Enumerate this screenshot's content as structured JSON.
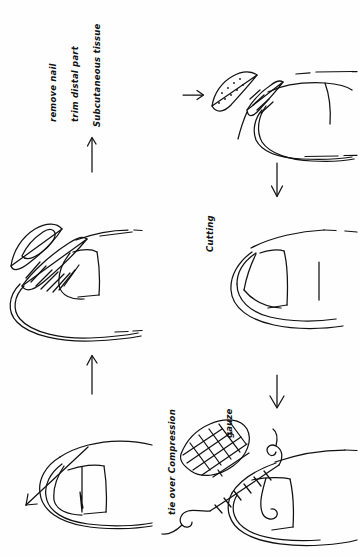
{
  "document": {
    "kind": "hand-drawn-diagram",
    "title": "Fingertip nail bed procedure sketch",
    "background_color": "#fefefe",
    "ink_color": "#111111",
    "width": 359,
    "height": 556
  },
  "annotations": {
    "remove_nail": "remove nail",
    "trim_distal_part": "trim distal part",
    "subcutaneous_tissue": "Subcutaneous tissue",
    "cutting": "Cutting",
    "tie_over_compression": "tie over Compression",
    "gauze": "gauze"
  },
  "panels": [
    {
      "id": "panel-top-right",
      "name": "nail-removal-panel",
      "step": 1,
      "description": "Fingertip with nail plate elevated and hatched nail bed exposed"
    },
    {
      "id": "panel-middle-right",
      "name": "cutting-panel",
      "step": 2,
      "description": "Fingertip outline with cutting line across the pulp"
    },
    {
      "id": "panel-bottom-right",
      "name": "tie-over-compression-panel",
      "step": 3,
      "description": "Fingertip with sutures and cross-hatched gauze bolster"
    },
    {
      "id": "panel-bottom-left",
      "name": "final-result-panel",
      "step": 4,
      "description": "Fingertip with closure line and directional arrow"
    },
    {
      "id": "panel-middle-left",
      "name": "flap-elevation-panel",
      "step": 5,
      "description": "Fingertip with elevated nail and hatched graft strip"
    }
  ],
  "arrows": [
    {
      "name": "arrow-right-top",
      "direction": "right",
      "x": 190,
      "y": 95
    },
    {
      "name": "arrow-down-right-upper",
      "direction": "down",
      "x": 277,
      "y": 170
    },
    {
      "name": "arrow-down-right-lower",
      "direction": "down",
      "x": 277,
      "y": 380
    },
    {
      "name": "arrow-up-left-lower",
      "direction": "up",
      "x": 92,
      "y": 355
    },
    {
      "name": "arrow-up-left-upper",
      "direction": "up",
      "x": 92,
      "y": 140
    }
  ]
}
